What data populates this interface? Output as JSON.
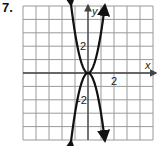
{
  "problem": {
    "number": "7."
  },
  "chart_data": {
    "type": "line",
    "title": "",
    "xlabel": "x",
    "ylabel": "y",
    "xlim": [
      -5,
      5
    ],
    "ylim": [
      -5,
      5
    ],
    "grid": true,
    "x_tick_labels": [
      {
        "value": 2,
        "label": "2"
      }
    ],
    "y_tick_labels": [
      {
        "value": 2,
        "label": "2"
      },
      {
        "value": -2,
        "label": "-2"
      }
    ],
    "series": [
      {
        "name": "upward parabola",
        "equation": "y = 3x^2",
        "x": [
          -1.3,
          -1,
          -0.5,
          0,
          0.5,
          1,
          1.3
        ],
        "y": [
          5.07,
          3,
          0.75,
          0,
          0.75,
          3,
          5.07
        ]
      },
      {
        "name": "downward parabola",
        "equation": "y = -3x^2",
        "x": [
          -1.3,
          -1,
          -0.5,
          0,
          0.5,
          1,
          1.3
        ],
        "y": [
          -5.07,
          -3,
          -0.75,
          0,
          -0.75,
          -3,
          -5.07
        ]
      }
    ],
    "colors": {
      "grid": "#9a9a9a",
      "axes": "#444444",
      "curve": "#111111"
    }
  }
}
